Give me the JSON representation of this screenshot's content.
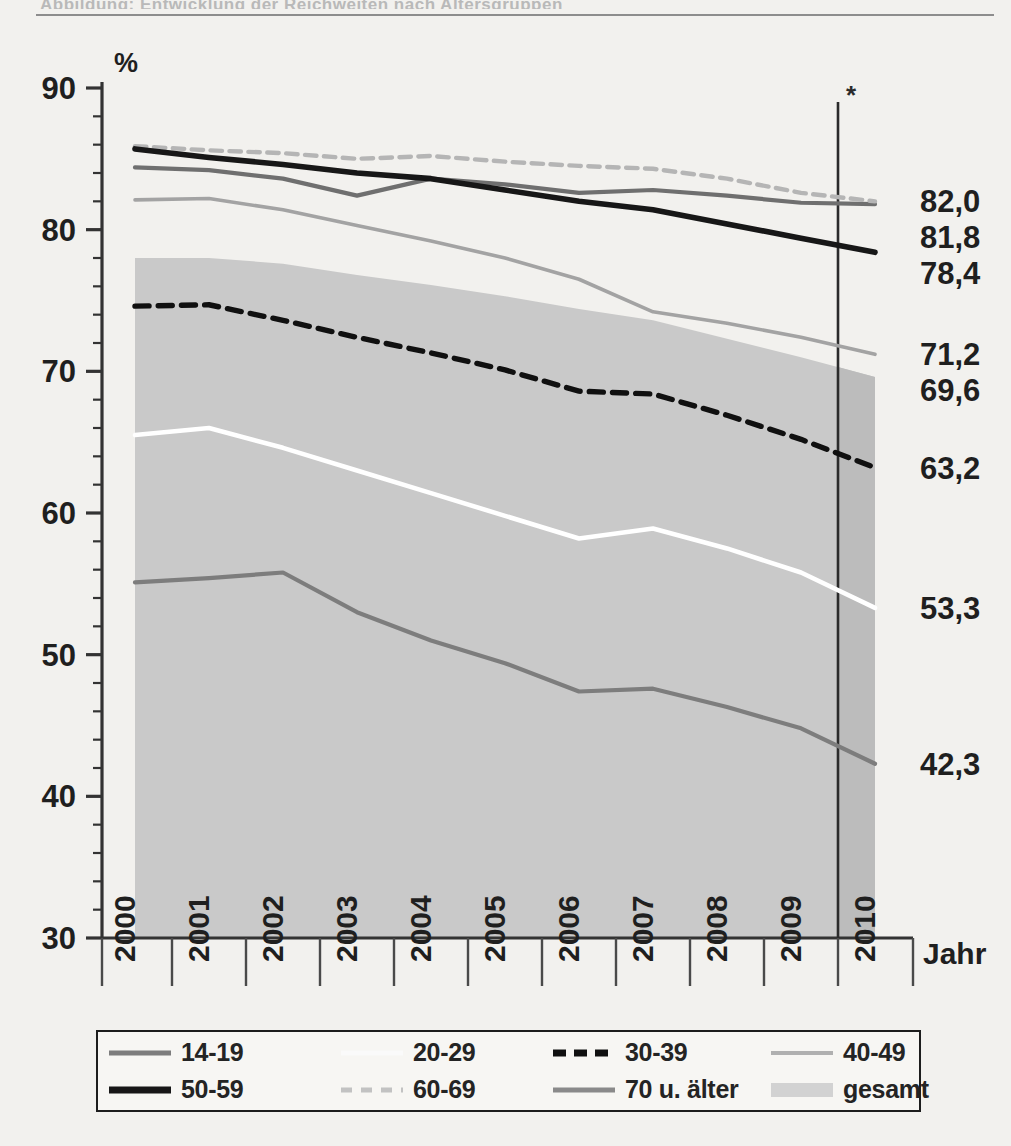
{
  "figure": {
    "top_ghost_text": "Abbildung: Entwicklung der Reichweiten nach Altersgruppen",
    "axis_note_symbol": "*"
  },
  "chart_data": {
    "type": "line",
    "title": "",
    "subtitle": "",
    "xlabel": "Jahr",
    "ylabel": "%",
    "ylim": [
      30,
      90
    ],
    "ytick_step": 10,
    "yminor_step": 2,
    "yticks": [
      "30",
      "40",
      "50",
      "60",
      "70",
      "80",
      "90"
    ],
    "grid": false,
    "legend_position": "bottom",
    "x": [
      2000,
      2001,
      2002,
      2003,
      2004,
      2005,
      2006,
      2007,
      2008,
      2009,
      2010
    ],
    "categories": [
      "2000",
      "2001",
      "2002",
      "2003",
      "2004",
      "2005",
      "2006",
      "2007",
      "2008",
      "2009",
      "2010"
    ],
    "projection_marker_x": 2009.5,
    "projection_note": "*",
    "series": [
      {
        "name": "14-19",
        "style": "solid",
        "color": "#7d7d7d",
        "width": 4.2,
        "values": [
          55.1,
          55.4,
          55.8,
          53.0,
          51.0,
          49.4,
          47.4,
          47.6,
          46.3,
          44.8,
          42.3
        ],
        "end_label": "42,3"
      },
      {
        "name": "20-29",
        "style": "solid",
        "color": "#ffffff",
        "width": 4.6,
        "values": [
          65.5,
          66.0,
          64.6,
          63.0,
          61.4,
          59.8,
          58.2,
          58.9,
          57.5,
          55.8,
          53.3
        ],
        "end_label": "53,3"
      },
      {
        "name": "30-39",
        "style": "dashed",
        "color": "#101010",
        "width": 5.4,
        "values": [
          74.6,
          74.7,
          73.6,
          72.4,
          71.3,
          70.1,
          68.6,
          68.4,
          66.9,
          65.2,
          63.2
        ],
        "end_label": "63,2"
      },
      {
        "name": "40-49",
        "style": "solid",
        "color": "#a3a3a3",
        "width": 3.6,
        "values": [
          82.1,
          82.2,
          81.4,
          80.3,
          79.2,
          78.0,
          76.5,
          74.2,
          73.4,
          72.4,
          71.2
        ],
        "end_label": "71,2"
      },
      {
        "name": "50-59",
        "style": "solid",
        "color": "#171717",
        "width": 5.6,
        "values": [
          85.7,
          85.1,
          84.6,
          84.0,
          83.6,
          82.8,
          82.0,
          81.4,
          80.4,
          79.4,
          78.4
        ],
        "end_label": "78,4"
      },
      {
        "name": "60-69",
        "style": "dashed",
        "color": "#b5b5b5",
        "width": 4.4,
        "values": [
          85.9,
          85.6,
          85.4,
          85.0,
          85.2,
          84.8,
          84.5,
          84.3,
          83.6,
          82.6,
          82.0
        ],
        "end_label": "82,0"
      },
      {
        "name": "70 u. älter",
        "style": "solid",
        "color": "#6f6f6f",
        "width": 4.2,
        "values": [
          84.4,
          84.2,
          83.6,
          82.4,
          83.6,
          83.2,
          82.6,
          82.8,
          82.4,
          81.9,
          81.8
        ],
        "end_label": "81,8"
      }
    ],
    "band": {
      "name": "gesamt",
      "color": "#c9c9c9",
      "upper": [
        78.0,
        78.0,
        77.6,
        76.8,
        76.1,
        75.3,
        74.4,
        73.6,
        72.3,
        71.0,
        69.6
      ],
      "lower": 30,
      "end_label": "69,6"
    },
    "right_labels": [
      "82,0",
      "81,8",
      "78,4",
      "71,2",
      "69,6",
      "63,2",
      "53,3",
      "42,3"
    ]
  },
  "legend": {
    "items": [
      {
        "label": "14-19",
        "swatch": "line-solid-gray"
      },
      {
        "label": "20-29",
        "swatch": "line-solid-white"
      },
      {
        "label": "30-39",
        "swatch": "line-dashed-black"
      },
      {
        "label": "40-49",
        "swatch": "line-solid-lightgray"
      },
      {
        "label": "50-59",
        "swatch": "line-solid-black"
      },
      {
        "label": "60-69",
        "swatch": "line-dashed-lightgray"
      },
      {
        "label": "70 u. älter",
        "swatch": "line-solid-midgray"
      },
      {
        "label": "gesamt",
        "swatch": "area-fill-gray"
      }
    ]
  }
}
